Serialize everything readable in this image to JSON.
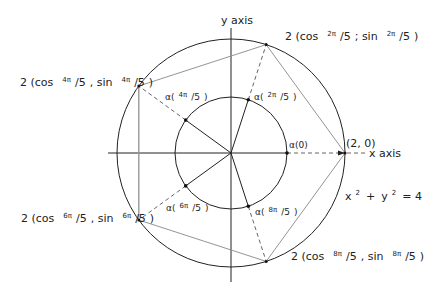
{
  "diagram": {
    "axes": {
      "x_label": "x  axis",
      "y_label": "y  axis"
    },
    "circle_equation": {
      "base": "x",
      "sq": "2",
      "plus": "+",
      "base2": "y",
      "sq2": "2",
      "rhs": "= 4"
    },
    "outer_points": [
      {
        "id": "p0",
        "label": "(2, 0)"
      },
      {
        "id": "p1",
        "prefix": "2 (cos",
        "num": "2π",
        "den": "/5",
        "mid": "; sin",
        "num2": "2π",
        "den2": "/5",
        "suffix": ")"
      },
      {
        "id": "p2",
        "prefix": "2 (cos",
        "num": "4π",
        "den": "/5",
        "mid": ", sin",
        "num2": "4π",
        "den2": "/5",
        "suffix": ")"
      },
      {
        "id": "p3",
        "prefix": "2 (cos",
        "num": "6π",
        "den": "/5",
        "mid": ", sin",
        "num2": "6π",
        "den2": "/5",
        "suffix": ")"
      },
      {
        "id": "p4",
        "prefix": "2 (cos",
        "num": "8π",
        "den": "/5",
        "mid": ", sin",
        "num2": "8π",
        "den2": "/5",
        "suffix": ")"
      }
    ],
    "inner_points": [
      {
        "id": "a0",
        "label": "α(0)"
      },
      {
        "id": "a1",
        "pre": "α(",
        "num": "2π",
        "den": "/5",
        "post": ")"
      },
      {
        "id": "a2",
        "pre": "α(",
        "num": "4π",
        "den": "/5",
        "post": ")"
      },
      {
        "id": "a3",
        "pre": "α(",
        "num": "6π",
        "den": "/5",
        "post": ")"
      },
      {
        "id": "a4",
        "pre": "α(",
        "num": "8π",
        "den": "/5",
        "post": ")"
      }
    ],
    "colors": {
      "line": "#222222",
      "polygon": "#777777",
      "dashed": "#555555"
    }
  }
}
